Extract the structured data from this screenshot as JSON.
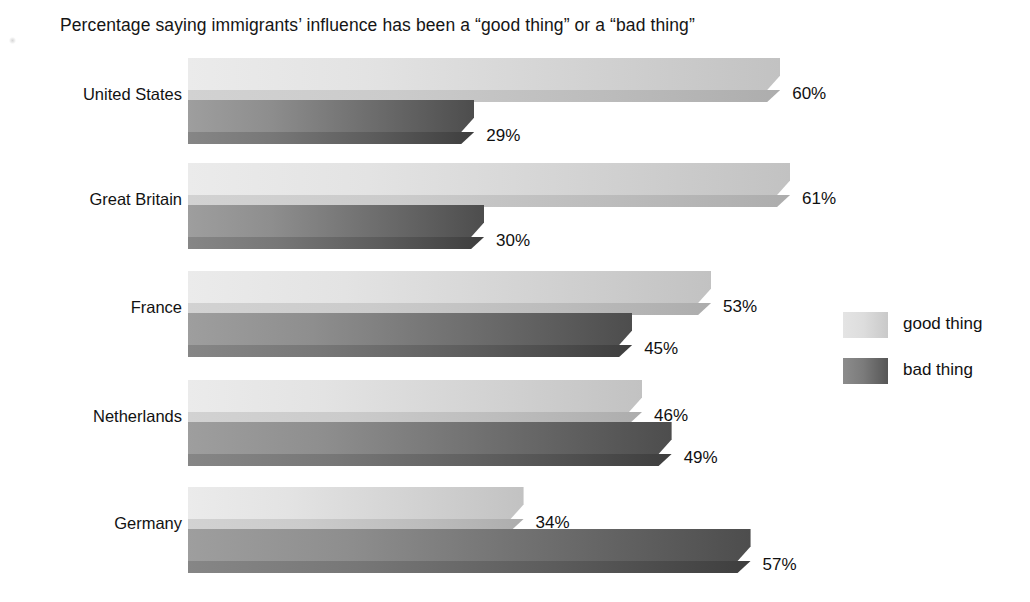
{
  "chart_data": {
    "type": "bar",
    "orientation": "horizontal",
    "title": "Percentage saying immigrants’ influence has been a “good thing” or a “bad thing”",
    "xlabel": "",
    "ylabel": "",
    "xlim": [
      0,
      70
    ],
    "grid": false,
    "legend_position": "right",
    "categories": [
      "United States",
      "Great Britain",
      "France",
      "Netherlands",
      "Germany"
    ],
    "series": [
      {
        "name": "good thing",
        "color": "#d5d5d5",
        "values": [
          60,
          61,
          53,
          46,
          34
        ],
        "value_labels": [
          "60%",
          "61%",
          "53%",
          "46%",
          "34%"
        ]
      },
      {
        "name": "bad thing",
        "color": "#6e6e6e",
        "values": [
          29,
          30,
          45,
          49,
          57
        ],
        "value_labels": [
          "29%",
          "30%",
          "45%",
          "49%",
          "57%"
        ]
      }
    ]
  },
  "legend": {
    "items": [
      {
        "label": "good thing",
        "swatch": "good"
      },
      {
        "label": "bad thing",
        "swatch": "bad"
      }
    ]
  },
  "layout": {
    "plot_left_px": 188,
    "px_per_percent": 9.87,
    "group_tops_px": [
      58,
      163,
      271,
      380,
      487
    ],
    "bar_height_px": 32,
    "bar_gap_px": 10
  }
}
